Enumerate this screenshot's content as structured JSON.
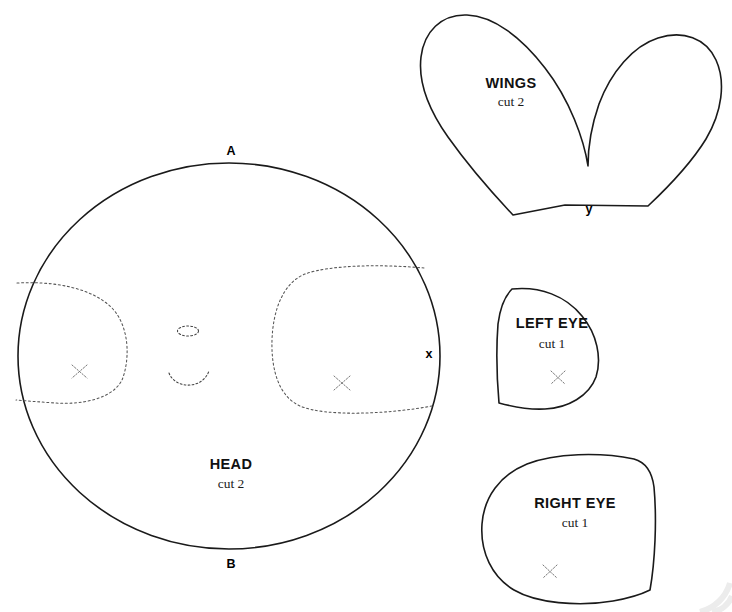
{
  "sheet": {
    "background_color": "#ffffff",
    "ink_color": "#1a1a1a",
    "guide_color": "#555555",
    "width": 732,
    "height": 612
  },
  "pieces": [
    {
      "id": "head",
      "title": "HEAD",
      "quantity": "cut 2",
      "title_x": 231,
      "title_y": 469,
      "qty_x": 231,
      "qty_y": 488
    },
    {
      "id": "wings",
      "title": "WINGS",
      "quantity": "cut 2",
      "title_x": 511,
      "title_y": 88,
      "qty_x": 511,
      "qty_y": 106
    },
    {
      "id": "left-eye",
      "title": "LEFT EYE",
      "quantity": "cut 1",
      "title_x": 552,
      "title_y": 328,
      "qty_x": 552,
      "qty_y": 348
    },
    {
      "id": "right-eye",
      "title": "RIGHT EYE",
      "quantity": "cut 1",
      "title_x": 575,
      "title_y": 508,
      "qty_x": 575,
      "qty_y": 527
    }
  ],
  "notches": [
    {
      "id": "head-top",
      "label": "A",
      "x": 231,
      "y": 155
    },
    {
      "id": "head-bottom",
      "label": "B",
      "x": 231,
      "y": 568
    },
    {
      "id": "head-side",
      "label": "x",
      "x": 429,
      "y": 358
    },
    {
      "id": "wings-bottom",
      "label": "y",
      "x": 589,
      "y": 213
    }
  ]
}
